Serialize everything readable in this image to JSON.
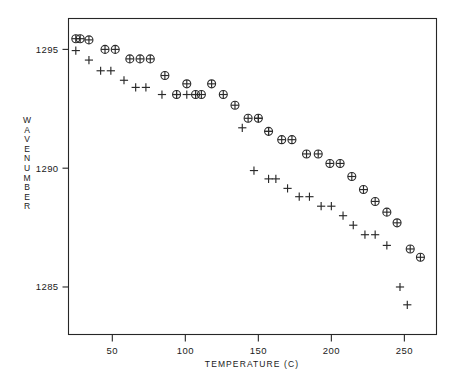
{
  "chart_data": {
    "type": "scatter",
    "title": "",
    "xlabel": "TEMPERATURE (C)",
    "ylabel": "WAVENUMBER",
    "xlim": [
      20,
      272
    ],
    "ylim": [
      1283.0,
      1296.3
    ],
    "xticks": [
      50,
      100,
      150,
      200,
      250
    ],
    "yticks": [
      1295,
      1290,
      1285
    ],
    "xticklabels": [
      "50",
      "100",
      "150",
      "200",
      "250"
    ],
    "yticklabels": [
      "1295",
      "1290",
      "1285"
    ],
    "grid": false,
    "legend": "none",
    "series": [
      {
        "name": "circled-plus-series",
        "marker": "circled-plus",
        "points": [
          [
            25,
            1295.45
          ],
          [
            28,
            1295.45
          ],
          [
            34,
            1295.4
          ],
          [
            45,
            1295.0
          ],
          [
            52,
            1295.0
          ],
          [
            62,
            1294.6
          ],
          [
            69,
            1294.6
          ],
          [
            76,
            1294.6
          ],
          [
            86,
            1293.9
          ],
          [
            101,
            1293.55
          ],
          [
            94,
            1293.1
          ],
          [
            111,
            1293.1
          ],
          [
            118,
            1293.55
          ],
          [
            107,
            1293.1
          ],
          [
            126,
            1293.1
          ],
          [
            134,
            1292.65
          ],
          [
            143,
            1292.1
          ],
          [
            150,
            1292.1
          ],
          [
            157,
            1291.55
          ],
          [
            166,
            1291.2
          ],
          [
            173,
            1291.2
          ],
          [
            183,
            1290.6
          ],
          [
            191,
            1290.6
          ],
          [
            199,
            1290.2
          ],
          [
            206,
            1290.2
          ],
          [
            214,
            1289.65
          ],
          [
            222,
            1289.1
          ],
          [
            230,
            1288.6
          ],
          [
            238,
            1288.15
          ],
          [
            245,
            1287.7
          ],
          [
            254,
            1286.6
          ],
          [
            261,
            1286.25
          ]
        ]
      },
      {
        "name": "plus-series",
        "marker": "plus",
        "points": [
          [
            25,
            1294.95
          ],
          [
            34,
            1294.55
          ],
          [
            42,
            1294.1
          ],
          [
            49,
            1294.1
          ],
          [
            58,
            1293.7
          ],
          [
            66,
            1293.4
          ],
          [
            73,
            1293.4
          ],
          [
            84,
            1293.1
          ],
          [
            94,
            1293.1
          ],
          [
            101,
            1293.1
          ],
          [
            107,
            1293.1
          ],
          [
            139,
            1291.7
          ],
          [
            150,
            1292.1
          ],
          [
            157,
            1291.55
          ],
          [
            147,
            1289.9
          ],
          [
            157,
            1289.55
          ],
          [
            162,
            1289.55
          ],
          [
            170,
            1289.15
          ],
          [
            178,
            1288.8
          ],
          [
            185,
            1288.8
          ],
          [
            193,
            1288.4
          ],
          [
            200,
            1288.4
          ],
          [
            208,
            1288.0
          ],
          [
            215,
            1287.6
          ],
          [
            223,
            1287.2
          ],
          [
            230,
            1287.2
          ],
          [
            238,
            1286.75
          ],
          [
            247,
            1285.0
          ],
          [
            252,
            1284.25
          ]
        ]
      }
    ]
  },
  "axes": {
    "x_title": "TEMPERATURE (C)",
    "y_title_letters": [
      "W",
      "A",
      "V",
      "E",
      "N",
      "U",
      "M",
      "B",
      "E",
      "R"
    ]
  }
}
